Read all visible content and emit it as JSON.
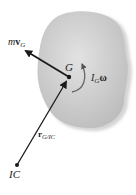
{
  "diagram": {
    "type": "rigid-body-momentum",
    "body": {
      "fill": "#c9c9c9",
      "shadow": "#d9d9d9"
    },
    "points": {
      "G": {
        "label": "G",
        "x": 69,
        "y": 77
      },
      "IC": {
        "label": "IC",
        "x": 17,
        "y": 165
      }
    },
    "vectors": {
      "linear_momentum": {
        "label_m": "m",
        "label_v": "v",
        "label_sub": "G"
      },
      "angular_momentum": {
        "label_I": "I",
        "label_sub": "G",
        "label_omega": "ω"
      },
      "position": {
        "label_r": "r",
        "label_sub": "G/IC"
      }
    },
    "colors": {
      "line": "#1a1a1a",
      "text": "#222222"
    }
  }
}
